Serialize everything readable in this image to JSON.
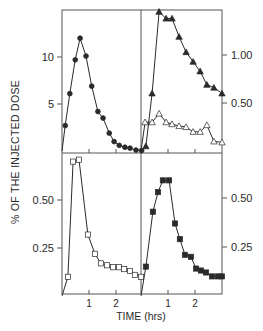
{
  "figure": {
    "ylabel": "% OF THE INJECTED DOSE",
    "xlabel": "TIME (hrs)"
  },
  "chart_data": [
    {
      "type": "line",
      "panel": "top-left",
      "title": "",
      "xlabel": "TIME (hrs)",
      "ylabel": "% OF THE INJECTED DOSE",
      "xlim": [
        0,
        2.95
      ],
      "ylim": [
        0,
        15.2
      ],
      "yticks": [
        5,
        10
      ],
      "ytick_labels": [
        "5",
        "10"
      ],
      "ytick_side": "left",
      "xticks": [
        1,
        2
      ],
      "series": [
        {
          "name": "filled diamonds",
          "marker": "diamond-filled",
          "x": [
            0,
            0.12,
            0.29,
            0.49,
            0.67,
            0.89,
            1.1,
            1.33,
            1.52,
            1.75,
            1.93,
            2.12,
            2.33,
            2.52,
            2.74,
            2.95
          ],
          "y": [
            0,
            2.7,
            6.1,
            9.7,
            12.0,
            10.1,
            6.9,
            4.2,
            3.5,
            1.9,
            1.0,
            0.6,
            0.4,
            0.3,
            0.1,
            0.05
          ]
        }
      ]
    },
    {
      "type": "line",
      "panel": "top-right",
      "title": "",
      "xlabel": "TIME (hrs)",
      "ylabel": "% OF THE INJECTED DOSE",
      "xlim": [
        0,
        3.0
      ],
      "ylim": [
        0,
        1.5
      ],
      "yticks": [
        0.5,
        1.0
      ],
      "ytick_labels": [
        "0.50",
        "1.00"
      ],
      "ytick_side": "right",
      "xticks": [
        1,
        2
      ],
      "series": [
        {
          "name": "filled triangles",
          "marker": "triangle-filled",
          "x": [
            0,
            0.18,
            0.41,
            0.67,
            0.93,
            1.15,
            1.41,
            1.67,
            1.93,
            2.19,
            2.44,
            2.7,
            3.0
          ],
          "y": [
            0,
            0.05,
            0.6,
            1.45,
            1.38,
            1.38,
            1.19,
            1.03,
            0.93,
            0.83,
            0.69,
            0.66,
            0.6
          ]
        },
        {
          "name": "open triangles",
          "marker": "triangle-open",
          "x": [
            0,
            0.15,
            0.41,
            0.67,
            0.93,
            1.15,
            1.41,
            1.67,
            1.93,
            2.19,
            2.44,
            2.7,
            3.0
          ],
          "y": [
            0,
            0.3,
            0.3,
            0.39,
            0.3,
            0.28,
            0.26,
            0.25,
            0.2,
            0.2,
            0.27,
            0.1,
            0.09
          ]
        }
      ]
    },
    {
      "type": "line",
      "panel": "bottom-left",
      "title": "",
      "xlabel": "TIME (hrs)",
      "ylabel": "% OF THE INJECTED DOSE",
      "xlim": [
        0,
        2.95
      ],
      "ylim": [
        0,
        0.74
      ],
      "yticks": [
        0.25,
        0.5
      ],
      "ytick_labels": [
        "0.25",
        "0.50"
      ],
      "ytick_side": "left",
      "xticks": [
        1,
        2
      ],
      "xtick_labels": [
        "1",
        "2"
      ],
      "series": [
        {
          "name": "open squares",
          "marker": "square-open",
          "x": [
            0,
            0.22,
            0.41,
            0.63,
            0.96,
            1.22,
            1.44,
            1.67,
            1.89,
            2.11,
            2.3,
            2.52,
            2.7,
            2.93
          ],
          "y": [
            0,
            0.1,
            0.7,
            0.71,
            0.32,
            0.22,
            0.17,
            0.16,
            0.15,
            0.15,
            0.14,
            0.13,
            0.11,
            0.1
          ]
        }
      ]
    },
    {
      "type": "line",
      "panel": "bottom-right",
      "title": "",
      "xlabel": "TIME (hrs)",
      "ylabel": "% OF THE INJECTED DOSE",
      "xlim": [
        0,
        3.0
      ],
      "ylim": [
        0,
        0.73
      ],
      "yticks": [
        0.25,
        0.5
      ],
      "ytick_labels": [
        "0.25",
        "0.50"
      ],
      "ytick_side": "right",
      "xticks": [
        1,
        2
      ],
      "xtick_labels": [
        "1",
        "2"
      ],
      "series": [
        {
          "name": "filled squares",
          "marker": "square-filled",
          "x": [
            0,
            0.18,
            0.44,
            0.63,
            0.81,
            1.04,
            1.26,
            1.44,
            1.63,
            1.85,
            2.04,
            2.22,
            2.41,
            2.63,
            2.85,
            3.0
          ],
          "y": [
            0,
            0.15,
            0.43,
            0.53,
            0.59,
            0.59,
            0.37,
            0.29,
            0.21,
            0.2,
            0.14,
            0.13,
            0.12,
            0.1,
            0.1,
            0.1
          ]
        }
      ]
    }
  ]
}
